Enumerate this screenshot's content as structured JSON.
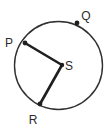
{
  "figure": {
    "type": "circle-geometry-diagram",
    "canvas": {
      "width": 110,
      "height": 130
    },
    "background_color": "#ffffff"
  },
  "circle": {
    "name": "circle-S",
    "center_x": 58.5,
    "center_y": 65.5,
    "radius": 44,
    "stroke_color": "#2f2f2f",
    "stroke_width": 1.4,
    "fill": "none"
  },
  "points": [
    {
      "id": "P",
      "label": "P",
      "x": 25,
      "y": 43,
      "on_circle": true,
      "dot_radius": 2.4,
      "label_x": 9,
      "label_y": 47,
      "color": "#1f1f1f"
    },
    {
      "id": "Q",
      "label": "Q",
      "x": 77,
      "y": 23,
      "on_circle": true,
      "dot_radius": 2.4,
      "label_x": 86,
      "label_y": 20,
      "color": "#1f1f1f"
    },
    {
      "id": "R",
      "label": "R",
      "x": 40,
      "y": 104,
      "on_circle": true,
      "dot_radius": 2.4,
      "label_x": 33,
      "label_y": 124,
      "color": "#1f1f1f"
    },
    {
      "id": "S",
      "label": "S",
      "x": 62,
      "y": 65,
      "on_circle": false,
      "is_center": true,
      "dot_radius": 2.2,
      "label_x": 69,
      "label_y": 70,
      "color": "#1f1f1f"
    }
  ],
  "segments": [
    {
      "id": "PS",
      "name": "radius-P-S",
      "from": "P",
      "to": "S",
      "x1": 25,
      "y1": 43,
      "x2": 62,
      "y2": 65,
      "stroke_color": "#1f1f1f",
      "stroke_width": 2.6
    },
    {
      "id": "SR",
      "name": "radius-S-R",
      "from": "S",
      "to": "R",
      "x1": 62,
      "y1": 65,
      "x2": 40,
      "y2": 104,
      "stroke_color": "#1f1f1f",
      "stroke_width": 2.6
    }
  ]
}
